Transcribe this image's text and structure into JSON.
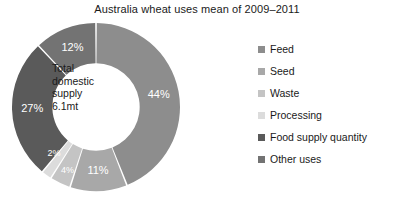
{
  "chart_data": {
    "type": "pie",
    "variant": "donut",
    "title": "Australia wheat uses mean of 2009–2011",
    "center_label_lines": [
      "Total",
      "domestic",
      "supply",
      "6.1mt"
    ],
    "center_label": "Total domestic supply 6.1mt",
    "categories": [
      "Feed",
      "Seed",
      "Waste",
      "Processing",
      "Food supply quantity",
      "Other uses"
    ],
    "values": [
      44,
      11,
      4,
      2,
      27,
      12
    ],
    "value_labels": [
      "44%",
      "11%",
      "4%",
      "2%",
      "27%",
      "12%"
    ],
    "unit": "%",
    "total": 100,
    "start_angle_deg": 0,
    "direction": "clockwise",
    "inner_radius_ratio": 0.52,
    "legend_position": "right",
    "grid": false,
    "xlabel": "",
    "ylabel": "",
    "colors": [
      "#8d8d8d",
      "#a8a8a8",
      "#c4c4c4",
      "#dcdcdc",
      "#5a5a5a",
      "#737373"
    ],
    "slices": [
      {
        "label": "Feed",
        "value": 44,
        "value_label": "44%",
        "color": "#8d8d8d"
      },
      {
        "label": "Seed",
        "value": 11,
        "value_label": "11%",
        "color": "#a8a8a8"
      },
      {
        "label": "Waste",
        "value": 4,
        "value_label": "4%",
        "color": "#c4c4c4"
      },
      {
        "label": "Processing",
        "value": 2,
        "value_label": "2%",
        "color": "#dcdcdc"
      },
      {
        "label": "Food supply quantity",
        "value": 27,
        "value_label": "27%",
        "color": "#5a5a5a"
      },
      {
        "label": "Other uses",
        "value": 12,
        "value_label": "12%",
        "color": "#737373"
      }
    ]
  },
  "legend": {
    "items": [
      {
        "label": "Feed",
        "color": "#8d8d8d"
      },
      {
        "label": "Seed",
        "color": "#a8a8a8"
      },
      {
        "label": "Waste",
        "color": "#c4c4c4"
      },
      {
        "label": "Processing",
        "color": "#dcdcdc"
      },
      {
        "label": "Food supply quantity",
        "color": "#5a5a5a"
      },
      {
        "label": "Other uses",
        "color": "#737373"
      }
    ]
  },
  "background_color": "#ffffff",
  "text_color": "#1a1a1a"
}
